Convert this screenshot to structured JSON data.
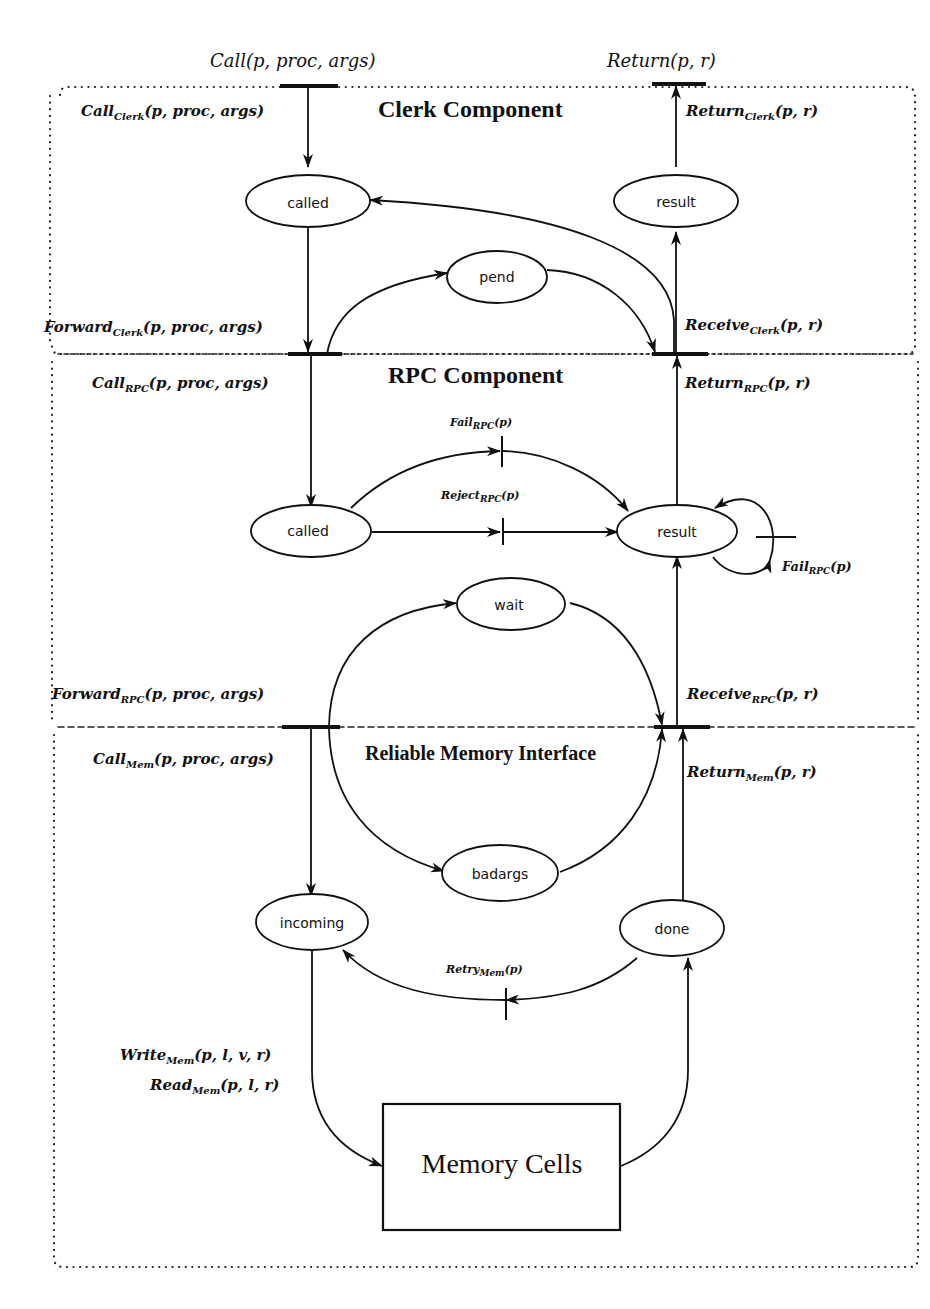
{
  "diagram": {
    "components": [
      {
        "id": "clerk",
        "title": "Clerk Component"
      },
      {
        "id": "rpc",
        "title": "RPC Component"
      },
      {
        "id": "mem",
        "title": "Reliable Memory Interface"
      }
    ],
    "external": {
      "call": {
        "name": "Call",
        "args": "(p, proc, args)"
      },
      "return": {
        "name": "Return",
        "args": "(p, r)"
      }
    },
    "places": {
      "clerk_called": "called",
      "clerk_result": "result",
      "clerk_pend": "pend",
      "rpc_called": "called",
      "rpc_result": "result",
      "rpc_wait": "wait",
      "mem_badargs": "badargs",
      "mem_incoming": "incoming",
      "mem_done": "done"
    },
    "memory_box": "Memory Cells",
    "labels": {
      "call_clerk": {
        "name": "Call",
        "sub": "Clerk",
        "args": "(p, proc, args)"
      },
      "return_clerk": {
        "name": "Return",
        "sub": "Clerk",
        "args": "(p, r)"
      },
      "forward_clerk": {
        "name": "Forward",
        "sub": "Clerk",
        "args": "(p, proc, args)"
      },
      "receive_clerk": {
        "name": "Receive",
        "sub": "Clerk",
        "args": "(p, r)"
      },
      "call_rpc": {
        "name": "Call",
        "sub": "RPC",
        "args": "(p, proc, args)"
      },
      "return_rpc": {
        "name": "Return",
        "sub": "RPC",
        "args": "(p, r)"
      },
      "fail_rpc_top": {
        "name": "Fail",
        "sub": "RPC",
        "args": "(p)"
      },
      "reject_rpc": {
        "name": "Reject",
        "sub": "RPC",
        "args": "(p)"
      },
      "fail_rpc_loop": {
        "name": "Fail",
        "sub": "RPC",
        "args": "(p)"
      },
      "forward_rpc": {
        "name": "Forward",
        "sub": "RPC",
        "args": "(p, proc, args)"
      },
      "receive_rpc": {
        "name": "Receive",
        "sub": "RPC",
        "args": "(p, r)"
      },
      "call_mem": {
        "name": "Call",
        "sub": "Mem",
        "args": "(p, proc, args)"
      },
      "return_mem": {
        "name": "Return",
        "sub": "Mem",
        "args": "(p, r)"
      },
      "retry_mem": {
        "name": "Retry",
        "sub": "Mem",
        "args": "(p)"
      },
      "write_mem": {
        "name": "Write",
        "sub": "Mem",
        "args": "(p, l, v, r)"
      },
      "read_mem": {
        "name": "Read",
        "sub": "Mem",
        "args": "(p, l, r)"
      }
    },
    "colors": {
      "ink": "#111111",
      "background": "#ffffff"
    }
  }
}
